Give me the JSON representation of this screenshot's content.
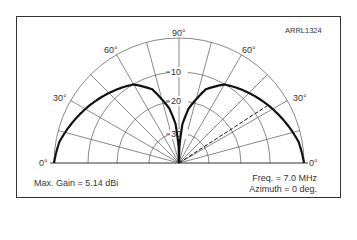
{
  "figure_id": "ARRL1324",
  "angle_labels": {
    "a0_left": "0°",
    "a30_left": "30°",
    "a60_left": "60°",
    "a90": "90°",
    "a60_right": "60°",
    "a30_right": "30°",
    "a0_right": "0°"
  },
  "ring_labels": [
    "10",
    "20",
    "30"
  ],
  "footer": {
    "max_gain": "Max. Gain = 5.14 dBi",
    "freq": "Freq. = 7.0 MHz",
    "azimuth": "Azimuth = 0 deg."
  },
  "colors": {
    "pattern": "#111111",
    "grid": "#555555",
    "frame": "#333333"
  },
  "chart_data": {
    "type": "polar-elevation",
    "title": "ARRL1324",
    "angular_axis": {
      "range_deg": [
        0,
        180
      ],
      "ticks_deg": [
        0,
        30,
        60,
        90,
        120,
        150,
        180
      ],
      "tick_labels": [
        "0°",
        "30°",
        "60°",
        "90°",
        "60°",
        "30°",
        "0°"
      ],
      "radial_grid_every_deg": 15
    },
    "radial_axis": {
      "unit": "dB (relative)",
      "rings_db": [
        0,
        -10,
        -20,
        -30
      ],
      "ring_labels": [
        "-10",
        "-20",
        "-30"
      ],
      "scale": "ARRL log-periodic"
    },
    "series": [
      {
        "name": "Elevation pattern",
        "style": "solid-bold",
        "elevation_deg": [
          0,
          10,
          20,
          30,
          40,
          50,
          60,
          70,
          80,
          85,
          90
        ],
        "relative_db": [
          0,
          -0.5,
          -1.5,
          -2.5,
          -3.5,
          -4.5,
          -5.5,
          -8,
          -14,
          -20,
          -40
        ]
      },
      {
        "name": "Peak direction marker",
        "style": "dashed",
        "elevation_deg": 33
      }
    ],
    "annotations": [
      "Max. Gain = 5.14 dBi",
      "Freq. = 7.0 MHz",
      "Azimuth = 0 deg."
    ]
  }
}
